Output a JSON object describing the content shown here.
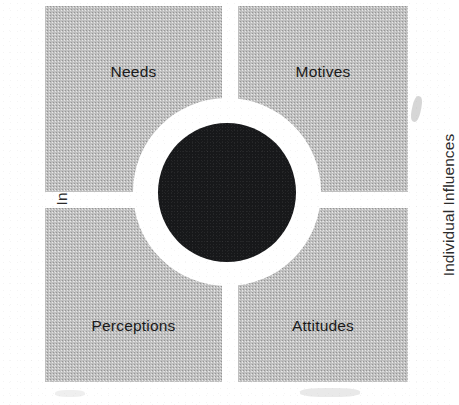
{
  "diagram": {
    "type": "quadrant-hub-diagram",
    "title": "",
    "axis_labels": {
      "left": "Individual Influences",
      "right": "Individual Influences"
    },
    "center": {
      "label": "",
      "shape": "filled-circle",
      "fill_color": "#17181a",
      "ring_color": "#ffffff"
    },
    "quadrant_fill_color": "#c0c0c0",
    "quadrants": [
      {
        "position": "top-left",
        "label": "Needs"
      },
      {
        "position": "top-right",
        "label": "Motives"
      },
      {
        "position": "bottom-left",
        "label": "Perceptions"
      },
      {
        "position": "bottom-right",
        "label": "Attitudes"
      }
    ]
  }
}
